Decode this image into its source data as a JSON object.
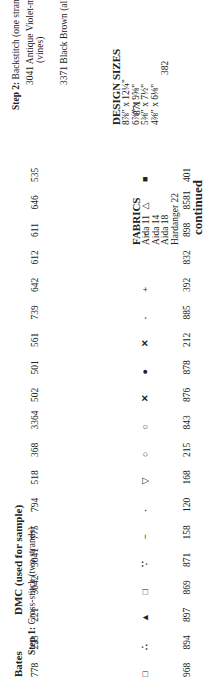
{
  "headers": {
    "bates": "Bates",
    "dmc": "DMC (used for sample)",
    "step1": "Step 1:",
    "step1_desc": "Cross-stitch (two strands)",
    "step2": "Step 2:",
    "step2_desc": "Backstitch (one strand)"
  },
  "step1_rows": [
    {
      "bates": "968",
      "symbol": "□",
      "dmc": "778",
      "name": "Antique Mauve-lt."
    },
    {
      "bates": "894",
      "symbol": "∴",
      "dmc": "223",
      "name": "Shell Pink-med."
    },
    {
      "bates": "897",
      "symbol": "▲",
      "dmc": "221",
      "name": "Shell Pink-dk."
    },
    {
      "bates": "869",
      "symbol": "□",
      "dmc": "3042",
      "name": "Antique Violet-lt."
    },
    {
      "bates": "871",
      "symbol": "∵",
      "dmc": "3041",
      "name": "Antique Violet-med."
    },
    {
      "bates": "158",
      "symbol": "−",
      "dmc": "775",
      "name": "Baby Blue-lt."
    },
    {
      "bates": "120",
      "symbol": "·",
      "dmc": "794",
      "name": "Cornflower Blue-lt."
    },
    {
      "bates": "168",
      "symbol": "▽",
      "dmc": "518",
      "name": "Wedgewood-lt."
    },
    {
      "bates": "215",
      "symbol": "○",
      "dmc": "368",
      "name": "Pistachio Green-lt."
    },
    {
      "bates": "843",
      "symbol": "○",
      "dmc": "3364",
      "name": "Pine Green"
    },
    {
      "bates": "876",
      "symbol": "✕",
      "dmc": "502",
      "name": "Blue Green"
    },
    {
      "bates": "878",
      "symbol": "●",
      "dmc": "501",
      "name": "Blue Green-dk."
    },
    {
      "bates": "212",
      "symbol": "✕",
      "dmc": "561",
      "name": "Jade-vy. dk."
    },
    {
      "bates": "885",
      "symbol": "·",
      "dmc": "739",
      "name": "Tan-ultra vy. lt."
    },
    {
      "bates": "392",
      "symbol": "+",
      "dmc": "642",
      "name": "Beige Gray-dk."
    },
    {
      "bates": "832",
      "symbol": "",
      "dmc": "612",
      "name": "Drab Brown-med."
    },
    {
      "bates": "898",
      "symbol": "−",
      "dmc": "611",
      "name": "Drab Brown-dk."
    },
    {
      "bates": "8581",
      "symbol": "△",
      "dmc": "646",
      "name": "Beaver Gray-dk."
    },
    {
      "bates": "401",
      "symbol": "■",
      "dmc": "535",
      "name": "Ash Gray-vy. lt."
    }
  ],
  "step2_rows": [
    {
      "bates": "871",
      "dmc": "3041",
      "name": "Antique Violet-med.",
      "note": "(vines)"
    },
    {
      "bates": "382",
      "dmc": "3371",
      "name": "Black Brown (all else)",
      "note": ""
    }
  ],
  "fabrics": {
    "title": "FABRICS",
    "items": [
      "Aida 11",
      "Aida 14",
      "Aida 18",
      "Hardanger 22"
    ]
  },
  "design_sizes": {
    "title": "DESIGN SIZES",
    "items": [
      "8⅞\" x 12¼\"",
      "6⅞\" x 9⅝\"",
      "5⅜\" x 7½\"",
      "4⅜\" x 6⅛\""
    ]
  },
  "footer": {
    "continued": "continued"
  }
}
